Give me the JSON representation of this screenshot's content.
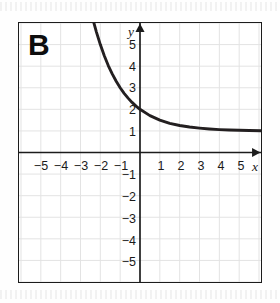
{
  "figure": {
    "panel_label": "B",
    "axis_labels": {
      "x": "x",
      "y": "y"
    }
  },
  "colors": {
    "curve": "#231f20",
    "axis": "#1c1c1c",
    "frame": "#1c1c1c",
    "grid": "#e3e3e3",
    "background": "#ffffff",
    "text": "#1a1a1a"
  },
  "chart_data": {
    "type": "line",
    "title": "B",
    "xlabel": "x",
    "ylabel": "y",
    "xlim": [
      -6.1,
      6.1
    ],
    "ylim": [
      -6.0,
      6.0
    ],
    "xticks": [
      -5,
      -4,
      -3,
      -2,
      -1,
      1,
      2,
      3,
      4,
      5
    ],
    "yticks": [
      -5,
      -4,
      -3,
      -2,
      -1,
      1,
      2,
      3,
      4,
      5
    ],
    "xtick_labels": [
      "-5",
      "-4",
      "-3",
      "-2",
      "-1",
      "1",
      "2",
      "3",
      "4",
      "5"
    ],
    "ytick_labels": [
      "-5",
      "-4",
      "-3",
      "-2",
      "-1",
      "1",
      "2",
      "3",
      "4",
      "5"
    ],
    "grid": true,
    "grid_spacing": 1,
    "legend": null,
    "series": [
      {
        "name": "y = (1/2)^x + 1",
        "equation": "y = (1/2)^x + 1",
        "asymptote": 1,
        "y_intercept": 2,
        "points": [
          {
            "x": -2.35,
            "y": 6.09
          },
          {
            "x": -2.2,
            "y": 5.59
          },
          {
            "x": -2.0,
            "y": 5.0
          },
          {
            "x": -1.8,
            "y": 4.48
          },
          {
            "x": -1.6,
            "y": 4.03
          },
          {
            "x": -1.4,
            "y": 3.64
          },
          {
            "x": -1.2,
            "y": 3.3
          },
          {
            "x": -1.0,
            "y": 3.0
          },
          {
            "x": -0.8,
            "y": 2.74
          },
          {
            "x": -0.6,
            "y": 2.52
          },
          {
            "x": -0.4,
            "y": 2.32
          },
          {
            "x": -0.2,
            "y": 2.15
          },
          {
            "x": 0.0,
            "y": 2.0
          },
          {
            "x": 0.5,
            "y": 1.71
          },
          {
            "x": 1.0,
            "y": 1.5
          },
          {
            "x": 1.5,
            "y": 1.35
          },
          {
            "x": 2.0,
            "y": 1.25
          },
          {
            "x": 2.5,
            "y": 1.18
          },
          {
            "x": 3.0,
            "y": 1.13
          },
          {
            "x": 3.5,
            "y": 1.09
          },
          {
            "x": 4.0,
            "y": 1.06
          },
          {
            "x": 4.5,
            "y": 1.04
          },
          {
            "x": 5.0,
            "y": 1.03
          },
          {
            "x": 5.5,
            "y": 1.02
          },
          {
            "x": 6.1,
            "y": 1.01
          }
        ]
      }
    ]
  }
}
